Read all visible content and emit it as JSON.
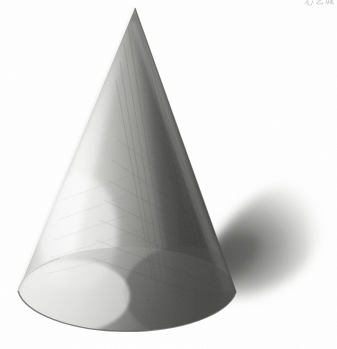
{
  "artwork": {
    "title": "Cone — graphite shading study",
    "medium": "pencil on paper",
    "subject": "geometric solid: right circular cone",
    "background_color": "#ffffff",
    "canvas": {
      "width": 337,
      "height": 349
    },
    "signature": {
      "text": "心艺城",
      "description": "faint handwritten signature, cropped by top edge",
      "color": "#9a9a96"
    },
    "light": {
      "direction": "upper-left",
      "highlight_side": "left",
      "core_shadow_side": "right-of-center",
      "reflected_light": "right silhouette edge"
    },
    "geometry": {
      "apex": {
        "x": 135,
        "y": 8
      },
      "base_left": {
        "x": 18,
        "y": 291
      },
      "base_right": {
        "x": 237,
        "y": 300
      },
      "base_bottom": {
        "x": 128,
        "y": 339
      },
      "base_ellipse_rx": 110,
      "base_ellipse_ry": 46
    },
    "cast_shadow": {
      "direction": "right",
      "start_x": 215,
      "end_x": 326,
      "top_y": 182,
      "bottom_y": 300,
      "softness": "very soft / feathered right edge"
    },
    "tones": {
      "paper_white": "#ffffff",
      "highlight": "#f6f6f4",
      "light_mid": "#d9d9d6",
      "mid": "#a8a8a4",
      "core_shadow": "#585856",
      "darkest": "#3c3c3a",
      "shadow_mid": "#9b9b98",
      "shadow_edge": "#d8d8d5",
      "outline": "#6e6e6b"
    }
  }
}
